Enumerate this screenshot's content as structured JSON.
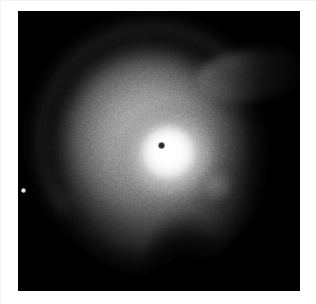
{
  "figure": {
    "kind": "astronomical-image",
    "colormap": "grayscale",
    "background_color": "#000000",
    "page_color": "#ffffff",
    "frame": {
      "x": 18,
      "y": 11,
      "width": 282,
      "height": 280
    }
  },
  "features": {
    "nucleus": {
      "name": "masked-nucleus",
      "description": "small dark dot marking the saturated/masked galactic nucleus",
      "x": 161,
      "y": 145,
      "color": "#121212"
    },
    "core": {
      "name": "bright-core",
      "description": "saturated white core of the bulge",
      "x": 150,
      "y": 141,
      "color": "#ffffff"
    },
    "bulge": {
      "name": "inner-bulge",
      "description": "broad bright bulge surrounding the core"
    },
    "disk": {
      "name": "galaxy-disk",
      "description": "extended mid-grey stellar disk"
    },
    "halo": {
      "name": "outer-halo",
      "description": "faint asymmetric outer halo with ragged low signal-to-noise edge"
    },
    "dust_lane": {
      "name": "dust-lane-arc",
      "description": "dark arc sweeping across the upper-left of the disk",
      "color": "#2a2a2a"
    },
    "spiral_arm": {
      "name": "outer-arm-band",
      "description": "brighter arc just outside the dust lane"
    },
    "spur": {
      "name": "upper-right-plume",
      "description": "diffuse extension reaching toward the upper-right corner"
    },
    "knot": {
      "name": "faint-knot",
      "description": "faint diffuse blob right of the core",
      "x": 215,
      "y": 185
    },
    "point_source": {
      "name": "field-star",
      "description": "isolated unresolved point source near the left frame edge",
      "x": 23,
      "y": 190,
      "color": "#ffffff"
    },
    "notch": {
      "name": "dark-notch",
      "description": "dark wedge of low surface brightness intruding from the bottom centre"
    }
  }
}
